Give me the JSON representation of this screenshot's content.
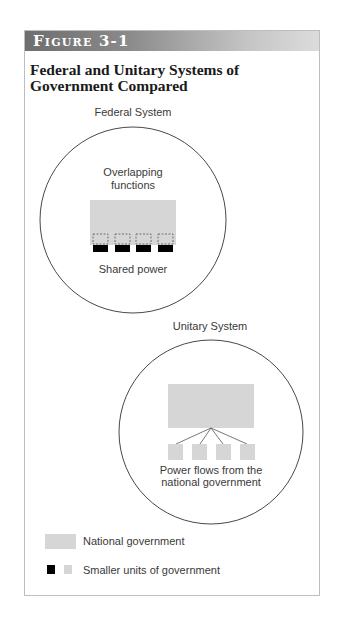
{
  "figure": {
    "label": "Figure 3-1",
    "title": "Federal and Unitary Systems of Government Compared"
  },
  "federal": {
    "heading": "Federal System",
    "top_label_line1": "Overlapping",
    "top_label_line2": "functions",
    "bottom_label": "Shared power",
    "smaller_units_count": 4
  },
  "unitary": {
    "heading": "Unitary System",
    "label_line1": "Power flows from the",
    "label_line2": "national government",
    "smaller_units_count": 4
  },
  "legend": {
    "national": "National government",
    "smaller": "Smaller units of government"
  },
  "colors": {
    "national_fill": "#d6d6d6",
    "federal_unit_fill": "#000000",
    "unitary_unit_fill": "#d6d6d6",
    "circle_stroke": "#333333",
    "header_dark": "#6e6e6e",
    "header_light": "#dcdcdc"
  }
}
